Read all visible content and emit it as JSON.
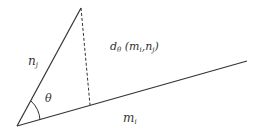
{
  "diagram": {
    "type": "geometry-angle-distance",
    "labels": {
      "vector_n": {
        "base": "n",
        "sub": "j"
      },
      "vector_m": {
        "base": "m",
        "sub": "i"
      },
      "angle": "θ",
      "distance": {
        "prefix": "d",
        "prefix_sub": "θ",
        "open": " (",
        "arg1_base": "m",
        "arg1_sub": "i",
        "sep": ",",
        "arg2_base": "n",
        "arg2_sub": "j",
        "close": ")"
      }
    },
    "colors": {
      "line": "#333333",
      "background": "#ffffff"
    }
  }
}
